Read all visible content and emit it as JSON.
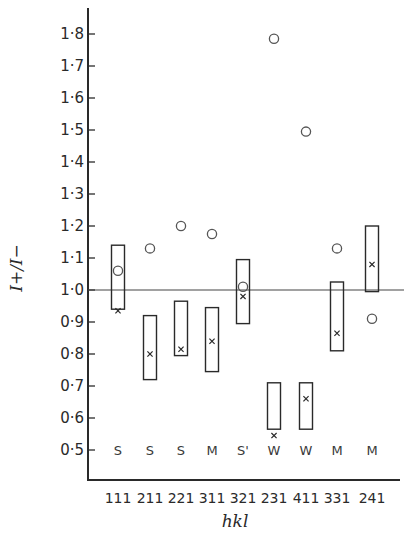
{
  "chart_data": {
    "type": "scatter",
    "title": "",
    "xlabel": "hkl",
    "ylabel": "I+/I−",
    "ylim": [
      0.4,
      1.85
    ],
    "yticks": [
      0.5,
      0.6,
      0.7,
      0.8,
      0.9,
      1.0,
      1.1,
      1.2,
      1.3,
      1.4,
      1.5,
      1.6,
      1.7,
      1.8
    ],
    "ytick_labels": [
      "0·5",
      "0·6",
      "0·7",
      "0·8",
      "0·9",
      "1·0",
      "1·1",
      "1·2",
      "1·3",
      "1·4",
      "1·5",
      "1·6",
      "1·7",
      "1·8"
    ],
    "reference_line": 1.0,
    "grid": false,
    "legend": null,
    "categories": [
      "111",
      "211",
      "221",
      "311",
      "321",
      "231",
      "411",
      "331",
      "241"
    ],
    "intensity_labels": [
      "S",
      "S",
      "S",
      "M",
      "S'",
      "W",
      "W",
      "M",
      "M"
    ],
    "series": [
      {
        "name": "observed range (box)",
        "marker": "rectangle",
        "low": [
          0.94,
          0.72,
          0.795,
          0.745,
          0.895,
          0.565,
          0.565,
          0.81,
          0.995
        ],
        "high": [
          1.14,
          0.92,
          0.965,
          0.945,
          1.095,
          0.71,
          0.71,
          1.025,
          1.2
        ]
      },
      {
        "name": "observed value (x)",
        "marker": "x",
        "values": [
          0.935,
          0.8,
          0.815,
          0.84,
          0.98,
          0.545,
          0.66,
          0.865,
          1.08
        ]
      },
      {
        "name": "calculated value (o)",
        "marker": "circle",
        "values": [
          1.06,
          1.13,
          1.2,
          1.175,
          1.01,
          1.785,
          1.495,
          1.13,
          0.91
        ]
      }
    ]
  },
  "labels": {
    "xlabel": "hkl",
    "ylabel": "I+/I−"
  }
}
